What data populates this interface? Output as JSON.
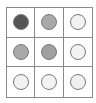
{
  "grid": {
    "rows": 3,
    "cols": 3,
    "cells": [
      {
        "state": "dark",
        "color": "#555555"
      },
      {
        "state": "medium",
        "color": "#a8a8a8"
      },
      {
        "state": "empty",
        "color": "#f2f2f2"
      },
      {
        "state": "medium",
        "color": "#a8a8a8"
      },
      {
        "state": "medium",
        "color": "#a0a0a0"
      },
      {
        "state": "empty",
        "color": "#f2f2f2"
      },
      {
        "state": "empty",
        "color": "#f2f2f2"
      },
      {
        "state": "empty",
        "color": "#f2f2f2"
      },
      {
        "state": "empty",
        "color": "#f0f0f0"
      }
    ]
  }
}
